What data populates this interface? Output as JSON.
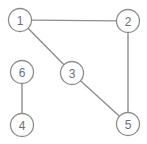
{
  "diagram": {
    "type": "node-link-graph",
    "canvas": {
      "width": 147,
      "height": 144,
      "background": "#ffffff"
    },
    "style": {
      "stroke_color": "#8d8d8d",
      "node_fill": "#ffffff",
      "label_color": "#6f6f6f",
      "node_radius": 11.5,
      "edge_width": 1.4
    },
    "nodes": [
      {
        "id": "1",
        "label": "1",
        "x": 20,
        "y": 20
      },
      {
        "id": "2",
        "label": "2",
        "x": 128,
        "y": 21
      },
      {
        "id": "3",
        "label": "3",
        "x": 72,
        "y": 73
      },
      {
        "id": "4",
        "label": "4",
        "x": 22,
        "y": 125
      },
      {
        "id": "5",
        "label": "5",
        "x": 128,
        "y": 124
      },
      {
        "id": "6",
        "label": "6",
        "x": 22,
        "y": 72
      }
    ],
    "edges": [
      {
        "id": "e-1-2",
        "from": "1",
        "to": "2"
      },
      {
        "id": "e-1-3",
        "from": "1",
        "to": "3"
      },
      {
        "id": "e-3-5",
        "from": "3",
        "to": "5"
      },
      {
        "id": "e-2-5",
        "from": "2",
        "to": "5"
      },
      {
        "id": "e-6-4",
        "from": "6",
        "to": "4"
      }
    ]
  }
}
